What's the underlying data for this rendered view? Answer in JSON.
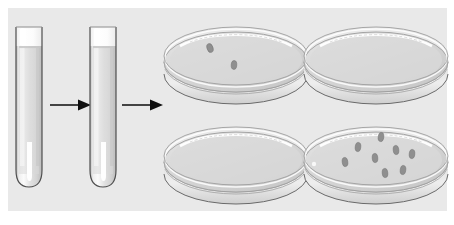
{
  "figure": {
    "background_color": "#e9e9e9",
    "page_color": "#ffffff",
    "width": 454,
    "height": 225,
    "panel": {
      "x": 8,
      "y": 8,
      "width": 439,
      "height": 203
    }
  },
  "palette": {
    "glass_outline": "#5a5a5a",
    "glass_fill_light": "#fdfdfd",
    "glass_fill_mid": "#dcdcdc",
    "glass_fill_dark": "#c9c9c9",
    "medium_fill": "#d8d8d8",
    "colony_color": "#8c8c8c",
    "colony_outline": "#6e6e6e",
    "arrow_color": "#1a1a1a",
    "highlight": "#ffffff"
  },
  "stages": [
    {
      "id": "tube-1",
      "type": "test-tube",
      "label": "Test tube 1",
      "x": 14,
      "y": 24,
      "width": 30,
      "height": 162,
      "liquid_level_pct": 80,
      "cap_present": false,
      "colonies": 0
    },
    {
      "id": "arrow-1",
      "type": "arrow",
      "label": "Transfer arrow 1",
      "x": 50,
      "y": 96,
      "length": 40,
      "direction": "right"
    },
    {
      "id": "tube-2",
      "type": "test-tube",
      "label": "Test tube 2",
      "x": 88,
      "y": 24,
      "width": 30,
      "height": 162,
      "liquid_level_pct": 80,
      "cap_present": false,
      "colonies": 0
    },
    {
      "id": "arrow-2",
      "type": "arrow",
      "label": "Transfer arrow 2",
      "x": 122,
      "y": 96,
      "length": 40,
      "direction": "right"
    }
  ],
  "dishes": [
    {
      "id": "dish-top-left",
      "label": "Petri dish top left",
      "position": "top-left",
      "x": 160,
      "y": 18,
      "width": 150,
      "height": 92,
      "colony_count": 2,
      "colonies": [
        {
          "cx": 50,
          "cy": 30,
          "rx": 3.0,
          "ry": 4.6,
          "rot": -18
        },
        {
          "cx": 74,
          "cy": 47,
          "rx": 2.8,
          "ry": 4.4,
          "rot": 4
        }
      ]
    },
    {
      "id": "dish-top-right",
      "label": "Petri dish top right",
      "position": "top-right",
      "x": 300,
      "y": 18,
      "width": 150,
      "height": 92,
      "colony_count": 0,
      "colonies": []
    },
    {
      "id": "dish-bottom-left",
      "label": "Petri dish bottom left",
      "position": "bottom-left",
      "x": 160,
      "y": 118,
      "width": 150,
      "height": 92,
      "colony_count": 0,
      "colonies": []
    },
    {
      "id": "dish-bottom-right",
      "label": "Petri dish bottom right",
      "position": "bottom-right",
      "x": 300,
      "y": 118,
      "width": 150,
      "height": 92,
      "colony_count": 8,
      "colonies": [
        {
          "cx": 45,
          "cy": 44,
          "rx": 2.8,
          "ry": 4.6,
          "rot": -8
        },
        {
          "cx": 58,
          "cy": 29,
          "rx": 2.8,
          "ry": 4.6,
          "rot": 6
        },
        {
          "cx": 75,
          "cy": 40,
          "rx": 2.8,
          "ry": 4.6,
          "rot": -4
        },
        {
          "cx": 81,
          "cy": 19,
          "rx": 2.8,
          "ry": 4.6,
          "rot": 8
        },
        {
          "cx": 96,
          "cy": 32,
          "rx": 2.8,
          "ry": 4.6,
          "rot": -6
        },
        {
          "cx": 112,
          "cy": 36,
          "rx": 2.8,
          "ry": 4.6,
          "rot": 5
        },
        {
          "cx": 85,
          "cy": 55,
          "rx": 2.8,
          "ry": 4.6,
          "rot": -5
        },
        {
          "cx": 103,
          "cy": 52,
          "rx": 2.8,
          "ry": 4.6,
          "rot": 7
        }
      ]
    }
  ]
}
